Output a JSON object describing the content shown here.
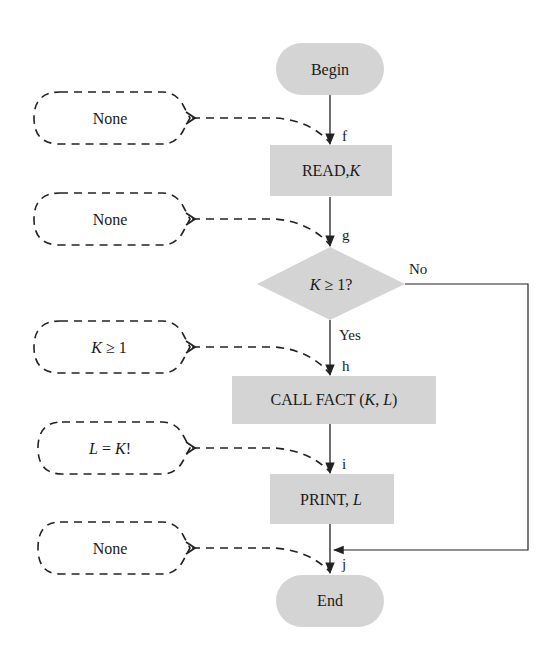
{
  "diagram": {
    "type": "flowchart",
    "colors": {
      "node_fill": "#d4d4d4",
      "line": "#222222",
      "background": "#ffffff"
    },
    "nodes": {
      "begin": {
        "label": "Begin",
        "shape": "terminal"
      },
      "read": {
        "label_main": "READ,",
        "label_var": "K",
        "shape": "process"
      },
      "decision": {
        "label_var": "K",
        "label_rest": " ≥ 1?",
        "shape": "decision"
      },
      "call": {
        "label_main": "CALL FACT (",
        "label_k": "K",
        "label_sep": ", ",
        "label_l": "L",
        "label_end": ")",
        "shape": "process"
      },
      "print": {
        "label_main": "PRINT, ",
        "label_var": "L",
        "shape": "process"
      },
      "end": {
        "label": "End",
        "shape": "terminal"
      }
    },
    "branch_labels": {
      "no": "No",
      "yes": "Yes"
    },
    "points": {
      "f": "f",
      "g": "g",
      "h": "h",
      "i": "i",
      "j": "j"
    },
    "assertions": [
      {
        "point": "f",
        "text": "None"
      },
      {
        "point": "g",
        "text": "None"
      },
      {
        "point": "h",
        "text_var": "K",
        "text_rest": " ≥ 1"
      },
      {
        "point": "i",
        "text_var1": "L",
        "text_mid": " = ",
        "text_var2": "K",
        "text_end": "!"
      },
      {
        "point": "j",
        "text": "None"
      }
    ]
  }
}
